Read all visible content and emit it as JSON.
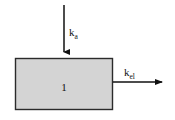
{
  "diagram": {
    "type": "one-compartment-pharmacokinetic-model",
    "background_color": "#ffffff",
    "compartment": {
      "label": "1",
      "fill_color": "#d4d4d4",
      "border_color": "#2b2b2b",
      "x": 15,
      "y": 58,
      "width": 98,
      "height": 52
    },
    "arrows": [
      {
        "name": "absorption-arrow",
        "direction": "down",
        "label_base": "k",
        "label_subscript": "a",
        "label_full": "ka",
        "color": "#111111",
        "x1": 64,
        "y1": 5,
        "x2": 64,
        "y2": 57
      },
      {
        "name": "elimination-arrow",
        "direction": "right",
        "label_base": "k",
        "label_subscript": "el",
        "label_full": "kel",
        "color": "#111111",
        "x1": 113,
        "y1": 82,
        "x2": 168,
        "y2": 82
      }
    ]
  }
}
